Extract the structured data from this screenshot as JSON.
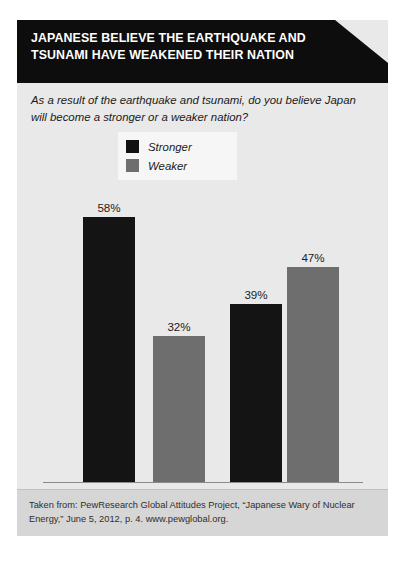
{
  "card": {
    "header": {
      "title_line1": "JAPANESE BELIEVE THE EARTHQUAKE AND",
      "title_line2": "TSUNAMI HAVE WEAKENED THEIR NATION",
      "background_color": "#0d0d0d",
      "text_color": "#ffffff"
    },
    "subtitle": {
      "line1": "As a result of the earthquake and tsunami, do you believe Japan",
      "line2": "will become a stronger or a weaker nation?"
    },
    "footer": {
      "line1": "Taken from: PewResearch Global Attitudes Project, “Japanese Wary of Nuclear",
      "line2": "Energy,” June 5, 2012, p. 4. www.pewglobal.org."
    }
  },
  "chart_data": {
    "type": "bar",
    "title": "JAPANESE BELIEVE THE EARTHQUAKE AND TSUNAMI HAVE WEAKENED THEIR NATION",
    "subtitle": "As a result of the earthquake and tsunami, do you believe Japan will become a stronger or a weaker nation?",
    "categories": [
      "2011",
      "2012"
    ],
    "series": [
      {
        "name": "Stronger",
        "color": "#141414",
        "values": [
          58,
          32
        ]
      },
      {
        "name": "Weaker",
        "color": "#6e6e6e",
        "values": [
          32,
          47
        ]
      }
    ],
    "bars": [
      {
        "group": "2011",
        "series": "Stronger",
        "value": 58,
        "label": "58%",
        "color": "#141414"
      },
      {
        "group": "2011",
        "series": "Weaker",
        "value": 32,
        "label": "32%",
        "color": "#6e6e6e"
      },
      {
        "group": "2012",
        "series": "Stronger",
        "value": 39,
        "label": "39%",
        "color": "#141414"
      },
      {
        "group": "2012",
        "series": "Weaker",
        "value": 47,
        "label": "47%",
        "color": "#6e6e6e"
      }
    ],
    "xlabel": "",
    "ylabel": "",
    "ylim": [
      0,
      58
    ],
    "grid": false,
    "legend": {
      "position": "top-center",
      "entries": [
        {
          "label": "Stronger",
          "color": "#141414"
        },
        {
          "label": "Weaker",
          "color": "#6e6e6e"
        }
      ]
    },
    "axis": {
      "baseline_visible": true,
      "tick_labels": [
        "2011",
        "2012"
      ]
    }
  }
}
